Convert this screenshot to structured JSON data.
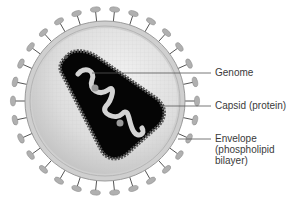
{
  "diagram": {
    "labels": [
      {
        "id": "genome",
        "text": "Genome",
        "y": 73
      },
      {
        "id": "capsid",
        "text": "Capsid (protein)",
        "y": 106
      },
      {
        "id": "envelope",
        "text": "Envelope\n(phospholipid\nbilayer)",
        "y": 139
      }
    ],
    "colors": {
      "background": "#ffffff",
      "interior": "#d9d9d9",
      "membrane": "#c8c8c8",
      "spike": "#a8a8a8",
      "capsid_fill": "#050505",
      "capsid_border": "#555555",
      "genome": "#cfcfcf",
      "leader_line": "#555555",
      "label_text": "#3a3a3a"
    }
  }
}
